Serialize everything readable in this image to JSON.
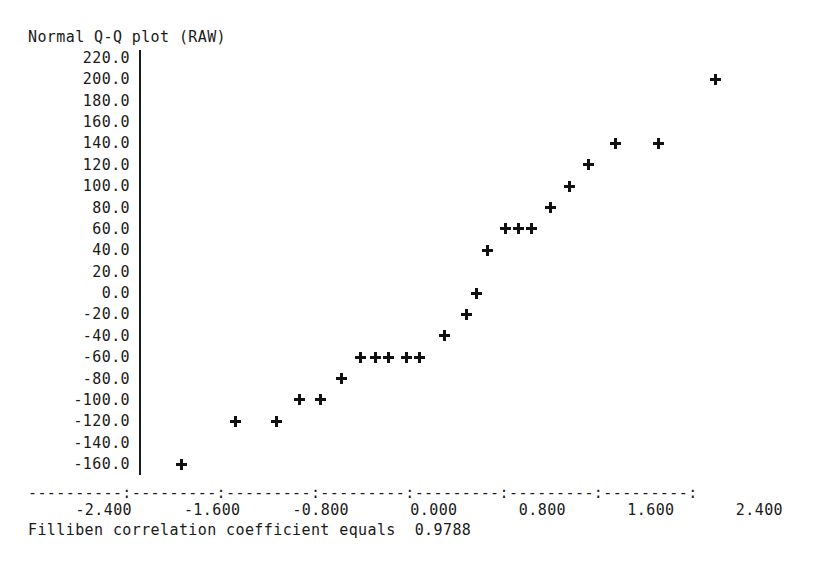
{
  "chart_data": {
    "type": "scatter",
    "title": "Normal Q-Q plot (RAW)",
    "xlabel": "",
    "ylabel": "",
    "grid": false,
    "legend": null,
    "xlim": [
      -2.8,
      2.8
    ],
    "ylim": [
      -170,
      230
    ],
    "x_ticks": [
      "-2.400",
      "-1.600",
      "-0.800",
      "0.000",
      "0.800",
      "1.600",
      "2.400"
    ],
    "x_tick_values": [
      -2.4,
      -1.6,
      -0.8,
      0.0,
      0.8,
      1.6,
      2.4
    ],
    "y_ticks": [
      "220.0",
      "200.0",
      "180.0",
      "160.0",
      "140.0",
      "120.0",
      "100.0",
      "80.0",
      "60.0",
      "40.0",
      "20.0",
      "0.0",
      "-20.0",
      "-40.0",
      "-60.0",
      "-80.0",
      "-100.0",
      "-120.0",
      "-140.0",
      "-160.0"
    ],
    "y_tick_values": [
      220,
      200,
      180,
      160,
      140,
      120,
      100,
      80,
      60,
      40,
      20,
      0,
      -20,
      -40,
      -60,
      -80,
      -100,
      -120,
      -140,
      -160
    ],
    "axis_rule": "----------:---------:---------:---------:---------:---------:---------:",
    "marker": "plus",
    "points": [
      {
        "x": -2.0,
        "y": -160
      },
      {
        "x": -1.6,
        "y": -120
      },
      {
        "x": -1.3,
        "y": -120
      },
      {
        "x": -1.13,
        "y": -100
      },
      {
        "x": -0.97,
        "y": -100
      },
      {
        "x": -0.82,
        "y": -80
      },
      {
        "x": -0.68,
        "y": -60
      },
      {
        "x": -0.57,
        "y": -60
      },
      {
        "x": -0.47,
        "y": -60
      },
      {
        "x": -0.34,
        "y": -60
      },
      {
        "x": -0.24,
        "y": -60
      },
      {
        "x": -0.06,
        "y": -40
      },
      {
        "x": 0.1,
        "y": -20
      },
      {
        "x": 0.18,
        "y": 0
      },
      {
        "x": 0.26,
        "y": 40
      },
      {
        "x": 0.39,
        "y": 60
      },
      {
        "x": 0.49,
        "y": 60
      },
      {
        "x": 0.58,
        "y": 60
      },
      {
        "x": 0.72,
        "y": 80
      },
      {
        "x": 0.86,
        "y": 100
      },
      {
        "x": 1.0,
        "y": 120
      },
      {
        "x": 1.2,
        "y": 140
      },
      {
        "x": 1.52,
        "y": 140
      },
      {
        "x": 1.94,
        "y": 200
      }
    ]
  },
  "footer": {
    "text": "Filliben correlation coefficient equals  0.9788",
    "statistic_name": "Filliben correlation coefficient",
    "statistic_value": "0.9788"
  },
  "colors": {
    "ink": "#1a1a1a",
    "marker": "#111111",
    "background": "#ffffff"
  }
}
